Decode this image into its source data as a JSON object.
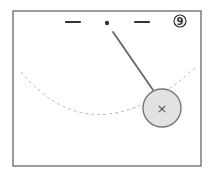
{
  "diagram": {
    "type": "pendulum-sketch",
    "panel_number": "9",
    "colors": {
      "frame": "#666666",
      "ink": "#333333",
      "rod": "#666666",
      "bob_fill": "#e2e2e2",
      "bob_stroke": "#777777",
      "arc": "#b5b5b5",
      "background": "#ffffff"
    },
    "frame": {
      "x": 13,
      "y": 11,
      "width": 188,
      "height": 155
    },
    "ceiling_marks": [
      {
        "x1": 66,
        "y1": 22,
        "x2": 80,
        "y2": 22
      },
      {
        "x1": 135,
        "y1": 22,
        "x2": 149,
        "y2": 22
      }
    ],
    "pivot": {
      "cx": 107,
      "cy": 23,
      "r": 2.2
    },
    "rod": {
      "x1": 113,
      "y1": 32,
      "x2": 153,
      "y2": 90
    },
    "bob": {
      "cx": 162,
      "cy": 108,
      "r": 19,
      "center_mark": "×"
    },
    "swing_path": {
      "d": "M 21 72 Q 95 160 197 66",
      "style": "dashed"
    }
  }
}
